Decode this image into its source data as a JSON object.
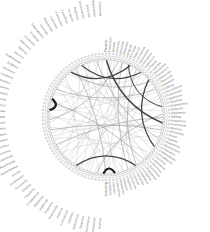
{
  "figure": {
    "type": "circular-edge-bundling-diagram",
    "title": "",
    "background": "#ffffff",
    "width": 210,
    "height": 232
  },
  "chart_data": {
    "type": "network",
    "layout": "radial-circular",
    "title": "",
    "subtitle": "",
    "xlabel": "",
    "ylabel": "",
    "grid": false,
    "legend": "none",
    "center": [
      106,
      117
    ],
    "node_ring_radius": 58,
    "label_inner_radius": 65,
    "label_outer_radius": 101,
    "node_count": 112,
    "colors": {
      "label_text": "#6f6f6f",
      "node_stroke": "#8d8d8d",
      "node_fill": "#ffffff",
      "ring_stroke": "#b9b9b9",
      "edge_light": "#c2c2c2",
      "edge_mid": "#9a9a9a",
      "edge_dark": "#3a3a3a",
      "edge_black": "#111111"
    },
    "nodes": [
      {
        "i": 0,
        "label": "Precariis"
      },
      {
        "i": 1,
        "label": "Franciscus"
      },
      {
        "i": 2,
        "label": "Venetiis"
      },
      {
        "i": 3,
        "label": "Florentia"
      },
      {
        "i": 4,
        "label": "Bononiae"
      },
      {
        "i": 5,
        "label": "Mediolani"
      },
      {
        "i": 6,
        "label": "Neapolis"
      },
      {
        "i": 7,
        "label": "Ferrariae"
      },
      {
        "i": 8,
        "label": "Patavium"
      },
      {
        "i": 9,
        "label": "Veronensis"
      },
      {
        "i": 10,
        "label": "Genuensis"
      },
      {
        "i": 11,
        "label": "Perusinus"
      },
      {
        "i": 12,
        "label": "Senensis"
      },
      {
        "i": 13,
        "label": "Pisanus"
      },
      {
        "i": 14,
        "label": "Lucensis"
      },
      {
        "i": 15,
        "label": "Mantuanus"
      },
      {
        "i": 16,
        "label": "Parmensis"
      },
      {
        "i": 17,
        "label": "Mutinensis"
      },
      {
        "i": 18,
        "label": "Ravennas"
      },
      {
        "i": 19,
        "label": "Ariminum"
      },
      {
        "i": 20,
        "label": "Urbinas"
      },
      {
        "i": 21,
        "label": "Anconitanus"
      },
      {
        "i": 22,
        "label": "Camerinum"
      },
      {
        "i": 23,
        "label": "Spoletinus"
      },
      {
        "i": 24,
        "label": "Tiburtinus"
      },
      {
        "i": 25,
        "label": "Praenestinus"
      },
      {
        "i": 26,
        "label": "Ostiensis"
      },
      {
        "i": 27,
        "label": "Albanensis"
      },
      {
        "i": 28,
        "label": "Velitrae"
      },
      {
        "i": 29,
        "label": "Anagninus"
      },
      {
        "i": 30,
        "label": "Ferentinum"
      },
      {
        "i": 31,
        "label": "Alatrinus"
      },
      {
        "i": 32,
        "label": "Veroliensis"
      },
      {
        "i": 33,
        "label": "Sorani"
      },
      {
        "i": 34,
        "label": "Aquinas"
      },
      {
        "i": 35,
        "label": "Casinensis"
      },
      {
        "i": 36,
        "label": "Beneventum"
      },
      {
        "i": 37,
        "label": "Capuanus"
      },
      {
        "i": 38,
        "label": "Salernitanus"
      },
      {
        "i": 39,
        "label": "Amalfitanus"
      },
      {
        "i": 40,
        "label": "Nolanus"
      },
      {
        "i": 41,
        "label": "Aversanus"
      },
      {
        "i": 42,
        "label": "Nucerinus"
      },
      {
        "i": 43,
        "label": "Surrentinus"
      },
      {
        "i": 44,
        "label": "Puteolanus"
      },
      {
        "i": 45,
        "label": "Cumanus"
      },
      {
        "i": 46,
        "label": "Gaietanus"
      },
      {
        "i": 47,
        "label": "Terracina"
      },
      {
        "i": 48,
        "label": "Setinus"
      },
      {
        "i": 49,
        "label": "Privernas"
      },
      {
        "i": 50,
        "label": "Signinus"
      },
      {
        "i": 51,
        "label": "Coranus"
      },
      {
        "i": 52,
        "label": "Ardeatinus"
      },
      {
        "i": 53,
        "label": "Laurentinus"
      },
      {
        "i": 54,
        "label": "Lavinium"
      },
      {
        "i": 55,
        "label": "Antiatinus"
      },
      {
        "i": 56,
        "label": "Nepesinus"
      },
      {
        "i": 57,
        "label": "Sutrinus"
      },
      {
        "i": 58,
        "label": "Viterbiensis"
      },
      {
        "i": 59,
        "label": "Cornetanus"
      },
      {
        "i": 60,
        "label": "Tarquinius"
      },
      {
        "i": 61,
        "label": "Vulsiniensis"
      },
      {
        "i": 62,
        "label": "Clusinus"
      },
      {
        "i": 63,
        "label": "Cortonensis"
      },
      {
        "i": 64,
        "label": "Aretinus"
      },
      {
        "i": 65,
        "label": "Pistoriensis"
      },
      {
        "i": 66,
        "label": "Prateneis"
      },
      {
        "i": 67,
        "label": "Volaterrae"
      },
      {
        "i": 68,
        "label": "Massanus"
      },
      {
        "i": 69,
        "label": "Grossetanus"
      },
      {
        "i": 70,
        "label": "Populonia"
      },
      {
        "i": 71,
        "label": "Elbanus"
      },
      {
        "i": 72,
        "label": "Corsicanus"
      },
      {
        "i": 73,
        "label": "Sardiniensis"
      },
      {
        "i": 74,
        "label": "Siculus"
      },
      {
        "i": 75,
        "label": "Panormitanus"
      },
      {
        "i": 76,
        "label": "Messanensis"
      },
      {
        "i": 77,
        "label": "Catanensis"
      },
      {
        "i": 78,
        "label": "Syracusanus"
      },
      {
        "i": 79,
        "label": "Agrigentinus"
      },
      {
        "i": 80,
        "label": "Drepanum"
      },
      {
        "i": 81,
        "label": "Lilybaeum"
      },
      {
        "i": 82,
        "label": "Cephaloedium"
      },
      {
        "i": 83,
        "label": "Tauromenium"
      },
      {
        "i": 84,
        "label": "Rhegium"
      },
      {
        "i": 85,
        "label": "Crotoniata"
      },
      {
        "i": 86,
        "label": "Tarentinus"
      },
      {
        "i": 87,
        "label": "Brundisinus"
      },
      {
        "i": 88,
        "label": "Barensis"
      },
      {
        "i": 89,
        "label": "Tranensis"
      },
      {
        "i": 90,
        "label": "Sipontinus"
      },
      {
        "i": 91,
        "label": "Lucerinus"
      },
      {
        "i": 92,
        "label": "Aeclanum"
      },
      {
        "i": 93,
        "label": "Aufidena"
      },
      {
        "i": 94,
        "label": "Sulmonensis"
      },
      {
        "i": 95,
        "label": "Aternum"
      },
      {
        "i": 96,
        "label": "Teatinus"
      },
      {
        "i": 97,
        "label": "Hadriensis"
      },
      {
        "i": 98,
        "label": "Asculanus"
      },
      {
        "i": 99,
        "label": "Firmanus"
      },
      {
        "i": 100,
        "label": "Maceratensis"
      },
      {
        "i": 101,
        "label": "Fanensis"
      },
      {
        "i": 102,
        "label": "Pisaurensis"
      },
      {
        "i": 103,
        "label": "Caesenas"
      },
      {
        "i": 104,
        "label": "Forliviensis"
      },
      {
        "i": 105,
        "label": "Faventinus"
      },
      {
        "i": 106,
        "label": "Imolensis"
      },
      {
        "i": 107,
        "label": "Regiensis"
      },
      {
        "i": 108,
        "label": "Cremonensis"
      },
      {
        "i": 109,
        "label": "Brixiensis"
      },
      {
        "i": 110,
        "label": "Bergomensis"
      },
      {
        "i": 111,
        "label": "Cremensis"
      }
    ],
    "edges": [
      {
        "s": 2,
        "t": 74,
        "w": 0.55,
        "shade": "light"
      },
      {
        "s": 5,
        "t": 61,
        "w": 0.5,
        "shade": "light"
      },
      {
        "s": 8,
        "t": 55,
        "w": 0.5,
        "shade": "light"
      },
      {
        "s": 11,
        "t": 70,
        "w": 0.5,
        "shade": "light"
      },
      {
        "s": 14,
        "t": 63,
        "w": 0.5,
        "shade": "light"
      },
      {
        "s": 17,
        "t": 86,
        "w": 0.5,
        "shade": "light"
      },
      {
        "s": 20,
        "t": 92,
        "w": 0.5,
        "shade": "light"
      },
      {
        "s": 23,
        "t": 79,
        "w": 0.5,
        "shade": "light"
      },
      {
        "s": 26,
        "t": 95,
        "w": 0.5,
        "shade": "light"
      },
      {
        "s": 29,
        "t": 101,
        "w": 0.5,
        "shade": "light"
      },
      {
        "s": 33,
        "t": 88,
        "w": 0.5,
        "shade": "light"
      },
      {
        "s": 36,
        "t": 104,
        "w": 0.5,
        "shade": "light"
      },
      {
        "s": 39,
        "t": 108,
        "w": 0.5,
        "shade": "light"
      },
      {
        "s": 42,
        "t": 0,
        "w": 0.5,
        "shade": "light"
      },
      {
        "s": 45,
        "t": 7,
        "w": 0.5,
        "shade": "light"
      },
      {
        "s": 48,
        "t": 12,
        "w": 0.5,
        "shade": "light"
      },
      {
        "s": 51,
        "t": 18,
        "w": 0.5,
        "shade": "light"
      },
      {
        "s": 57,
        "t": 24,
        "w": 0.5,
        "shade": "light"
      },
      {
        "s": 60,
        "t": 30,
        "w": 0.5,
        "shade": "light"
      },
      {
        "s": 65,
        "t": 34,
        "w": 0.5,
        "shade": "light"
      },
      {
        "s": 68,
        "t": 3,
        "w": 0.5,
        "shade": "light"
      },
      {
        "s": 72,
        "t": 40,
        "w": 0.5,
        "shade": "light"
      },
      {
        "s": 77,
        "t": 44,
        "w": 0.5,
        "shade": "light"
      },
      {
        "s": 81,
        "t": 50,
        "w": 0.5,
        "shade": "light"
      },
      {
        "s": 85,
        "t": 54,
        "w": 0.5,
        "shade": "light"
      },
      {
        "s": 90,
        "t": 58,
        "w": 0.5,
        "shade": "light"
      },
      {
        "s": 94,
        "t": 66,
        "w": 0.5,
        "shade": "light"
      },
      {
        "s": 98,
        "t": 71,
        "w": 0.5,
        "shade": "light"
      },
      {
        "s": 103,
        "t": 76,
        "w": 0.5,
        "shade": "light"
      },
      {
        "s": 107,
        "t": 82,
        "w": 0.5,
        "shade": "light"
      },
      {
        "s": 110,
        "t": 87,
        "w": 0.5,
        "shade": "light"
      },
      {
        "s": 1,
        "t": 47,
        "w": 0.5,
        "shade": "light"
      },
      {
        "s": 6,
        "t": 91,
        "w": 0.5,
        "shade": "light"
      },
      {
        "s": 13,
        "t": 99,
        "w": 0.5,
        "shade": "light"
      },
      {
        "s": 21,
        "t": 67,
        "w": 0.5,
        "shade": "light"
      },
      {
        "s": 31,
        "t": 78,
        "w": 0.5,
        "shade": "light"
      },
      {
        "s": 41,
        "t": 96,
        "w": 0.5,
        "shade": "light"
      },
      {
        "s": 53,
        "t": 106,
        "w": 0.5,
        "shade": "light"
      },
      {
        "s": 62,
        "t": 9,
        "w": 0.5,
        "shade": "light"
      },
      {
        "s": 73,
        "t": 22,
        "w": 0.5,
        "shade": "light"
      },
      {
        "s": 84,
        "t": 37,
        "w": 0.5,
        "shade": "light"
      },
      {
        "s": 97,
        "t": 52,
        "w": 0.5,
        "shade": "light"
      },
      {
        "s": 105,
        "t": 64,
        "w": 0.5,
        "shade": "light"
      },
      {
        "s": 111,
        "t": 69,
        "w": 0.5,
        "shade": "light"
      },
      {
        "s": 4,
        "t": 83,
        "w": 0.65,
        "shade": "mid"
      },
      {
        "s": 16,
        "t": 100,
        "w": 0.65,
        "shade": "mid"
      },
      {
        "s": 28,
        "t": 75,
        "w": 0.65,
        "shade": "mid"
      },
      {
        "s": 46,
        "t": 10,
        "w": 0.65,
        "shade": "mid"
      },
      {
        "s": 59,
        "t": 27,
        "w": 0.65,
        "shade": "mid"
      },
      {
        "s": 89,
        "t": 43,
        "w": 0.65,
        "shade": "mid"
      },
      {
        "s": 102,
        "t": 56,
        "w": 0.65,
        "shade": "mid"
      },
      {
        "s": 19,
        "t": 93,
        "w": 0.65,
        "shade": "mid"
      },
      {
        "s": 35,
        "t": 109,
        "w": 0.65,
        "shade": "mid"
      },
      {
        "s": 49,
        "t": 5,
        "w": 0.65,
        "shade": "mid"
      },
      {
        "s": 80,
        "t": 32,
        "w": 0.65,
        "shade": "mid"
      },
      {
        "s": 15,
        "t": 38,
        "w": 1.25,
        "shade": "dark"
      },
      {
        "s": 100,
        "t": 8,
        "w": 1.35,
        "shade": "dark"
      },
      {
        "s": 104,
        "t": 12,
        "w": 1.1,
        "shade": "dark"
      },
      {
        "s": 7,
        "t": 25,
        "w": 1.0,
        "shade": "dark"
      },
      {
        "s": 66,
        "t": 46,
        "w": 1.3,
        "shade": "dark"
      },
      {
        "s": 53,
        "t": 57,
        "w": 2.1,
        "shade": "black"
      },
      {
        "s": 86,
        "t": 90,
        "w": 2.3,
        "shade": "black"
      },
      {
        "s": 0,
        "t": 30,
        "w": 1.5,
        "shade": "dark"
      }
    ]
  }
}
